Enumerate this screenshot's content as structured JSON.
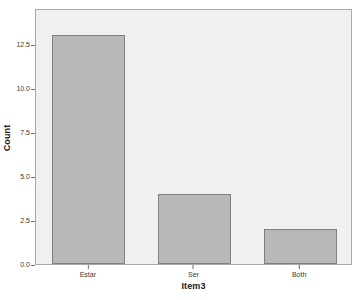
{
  "chart_data": {
    "type": "bar",
    "title": "",
    "subtitle": "",
    "xlabel": "Item3",
    "ylabel": "Count",
    "categories": [
      "Estar",
      "Ser",
      "Both"
    ],
    "values": [
      13,
      4,
      2
    ],
    "series": [
      {
        "name": "Count",
        "values": [
          13,
          4,
          2
        ]
      }
    ],
    "ylim": [
      0,
      14.55
    ],
    "xlim": [
      0,
      3
    ],
    "y_ticks": [
      0.0,
      2.5,
      5.0,
      7.5,
      10.0,
      12.5
    ],
    "y_tick_labels": [
      "0.0",
      "2.5",
      "5.0",
      "7.5",
      "10.0",
      "12.5"
    ],
    "x_tick_labels": [
      "Estar",
      "Ser",
      "Both"
    ],
    "grid": false,
    "legend": null,
    "legend_position": "none",
    "annotations": [],
    "colors": {
      "bar_fill": "#b8b8b8",
      "bar_border": "#808080",
      "plot_background": "#f0f0f0",
      "frame_border": "#a9a9a9",
      "page_background": "#ffffff",
      "tick_text": "#3a3a3a",
      "axis_title": "#1a1a1a",
      "tick_mark": "#6f6f6f"
    }
  }
}
